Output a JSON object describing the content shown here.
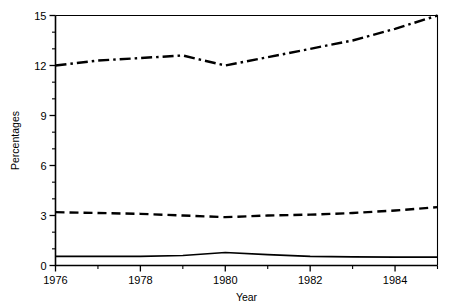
{
  "chart_data": {
    "type": "line",
    "title": "",
    "xlabel": "Year",
    "ylabel": "Percentages",
    "xlim": [
      1976,
      1985
    ],
    "ylim": [
      0,
      15
    ],
    "grid": false,
    "legend": "none",
    "x_major_ticks": [
      1976,
      1978,
      1980,
      1982,
      1984
    ],
    "x_major_tick_labels": [
      "1976",
      "1978",
      "1980",
      "1982",
      "1984"
    ],
    "x_minor_ticks": [
      1977,
      1979,
      1981,
      1983,
      1985
    ],
    "y_major_ticks": [
      0,
      3,
      6,
      9,
      12,
      15
    ],
    "y_major_tick_labels": [
      "0",
      "3",
      "6",
      "9",
      "12",
      "15"
    ],
    "y_minor_ticks": [
      1,
      2,
      4,
      5,
      7,
      8,
      10,
      11,
      13,
      14
    ],
    "x": [
      1976,
      1977,
      1978,
      1979,
      1980,
      1981,
      1982,
      1983,
      1984,
      1985
    ],
    "series": [
      {
        "name": "upper-series",
        "style": "dash-dot",
        "color": "#000000",
        "values": [
          12.0,
          12.3,
          12.45,
          12.6,
          12.0,
          12.5,
          13.0,
          13.5,
          14.2,
          15.0
        ]
      },
      {
        "name": "middle-series",
        "style": "dashed",
        "color": "#000000",
        "values": [
          3.2,
          3.15,
          3.1,
          3.0,
          2.9,
          3.0,
          3.05,
          3.15,
          3.3,
          3.5
        ]
      },
      {
        "name": "lower-series",
        "style": "solid",
        "color": "#000000",
        "values": [
          0.55,
          0.55,
          0.55,
          0.6,
          0.78,
          0.65,
          0.55,
          0.52,
          0.5,
          0.5
        ]
      }
    ]
  },
  "axes": {
    "y_axis_title": "Percentages",
    "x_axis_title": "Year"
  }
}
